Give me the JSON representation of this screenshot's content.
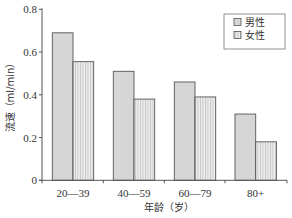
{
  "chart_data": {
    "type": "bar",
    "title": "",
    "xlabel": "年龄（岁）",
    "ylabel": "流速（ml/min）",
    "ylim": [
      0,
      0.8
    ],
    "yticks": [
      0,
      0.2,
      0.4,
      0.6,
      0.8
    ],
    "ytick_labels": [
      "0",
      "0.2",
      "0.4",
      "0.6",
      "0.8"
    ],
    "categories": [
      "20—39",
      "40—59",
      "60—79",
      "80+"
    ],
    "series": [
      {
        "name": "男性",
        "values": [
          0.69,
          0.51,
          0.46,
          0.31
        ],
        "fill": "#d6d6d6",
        "pattern": "solid"
      },
      {
        "name": "女性",
        "values": [
          0.555,
          0.38,
          0.39,
          0.18
        ],
        "fill": "#e6e6e6",
        "pattern": "vertical-stripes"
      }
    ],
    "legend_position": "top-right",
    "grid": false
  },
  "colors": {
    "axis": "#555555",
    "bar_border": "#555555",
    "male_fill": "#d6d6d6",
    "female_fill": "#e6e6e6",
    "female_stripe": "#bdbdbd"
  }
}
